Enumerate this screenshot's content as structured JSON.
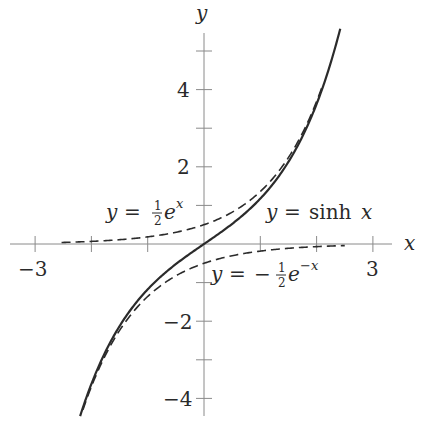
{
  "chart_data": {
    "type": "line",
    "title": "",
    "xlabel": "x",
    "ylabel": "y",
    "xlim": [
      -3.3,
      3.3
    ],
    "ylim": [
      -4.5,
      5.5
    ],
    "grid": false,
    "legend": "none (inline curve labels)",
    "x_ticks": [
      -3,
      -2,
      -1,
      1,
      2,
      3
    ],
    "x_tick_labels": [
      {
        "value": -3,
        "label": "−3"
      },
      {
        "value": 3,
        "label": "3"
      }
    ],
    "y_ticks": [
      -4,
      -3,
      -2,
      -1,
      1,
      2,
      3,
      4,
      5
    ],
    "y_tick_labels": [
      {
        "value": 4,
        "label": "4"
      },
      {
        "value": 2,
        "label": "2"
      },
      {
        "value": -2,
        "label": "−2"
      },
      {
        "value": -4,
        "label": "−4"
      }
    ],
    "series": [
      {
        "name": "y = sinh x",
        "style": "solid",
        "function": "sinh(x)",
        "domain": [
          -2.2,
          2.42
        ],
        "x": [
          -2.2,
          -2,
          -1.5,
          -1,
          -0.5,
          0,
          0.5,
          1,
          1.5,
          2,
          2.42
        ],
        "values": [
          -4.46,
          -3.63,
          -2.13,
          -1.18,
          -0.52,
          0,
          0.52,
          1.18,
          2.13,
          3.63,
          5.58
        ]
      },
      {
        "name": "y = 1/2 e^x",
        "style": "dashed",
        "function": "0.5*exp(x)",
        "domain": [
          -2.53,
          2.1
        ],
        "x": [
          -2.5,
          -2,
          -1,
          0,
          1,
          2
        ],
        "values": [
          0.04,
          0.07,
          0.18,
          0.5,
          1.36,
          3.69
        ]
      },
      {
        "name": "y = -1/2 e^-x",
        "style": "dashed",
        "function": "-0.5*exp(-x)",
        "domain": [
          -2.15,
          2.5
        ],
        "x": [
          -2,
          -1,
          0,
          1,
          2,
          2.5
        ],
        "values": [
          -3.69,
          -1.36,
          -0.5,
          -0.18,
          -0.07,
          -0.04
        ]
      }
    ],
    "annotations": [
      {
        "text": "y = ½ e^x",
        "near": [
          -1.75,
          0.7
        ]
      },
      {
        "text": "y = sinh x",
        "near": [
          1.9,
          0.7
        ]
      },
      {
        "text": "y = −½ e^−x",
        "near": [
          0.95,
          -0.75
        ]
      }
    ]
  },
  "labels": {
    "x_axis": "x",
    "y_axis": "y",
    "tick_neg3": "−3",
    "tick_3": "3",
    "tick_4": "4",
    "tick_2": "2",
    "tick_neg2": "−2",
    "tick_neg4": "−4",
    "ann_exp": {
      "lhs": "y",
      "eq": "=",
      "num": "1",
      "den": "2",
      "base": "e",
      "exp": "x"
    },
    "ann_sinh": {
      "lhs": "y",
      "eq": "=",
      "fn": "sinh",
      "arg": "x"
    },
    "ann_negexp": {
      "lhs": "y",
      "eq": "=",
      "minus": "−",
      "num": "1",
      "den": "2",
      "base": "e",
      "exp": "−x"
    }
  },
  "layout": {
    "origin_px": [
      204,
      244
    ],
    "x_unit_px": 56.3,
    "y_unit_px": 38.6
  }
}
